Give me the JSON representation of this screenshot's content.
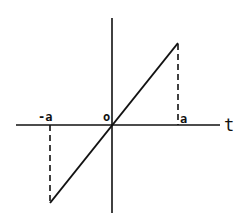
{
  "diagram": {
    "type": "odd-function ramp graph",
    "axis_labels": {
      "horizontal": "t"
    },
    "tick_labels": {
      "negative": "-a",
      "origin": "o",
      "positive": "a"
    },
    "colors": {
      "stroke": "#111111",
      "background": "#ffffff"
    }
  }
}
